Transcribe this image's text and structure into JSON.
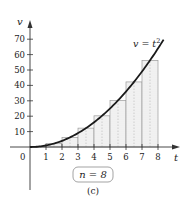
{
  "chart_data": {
    "type": "bar",
    "title": "",
    "subtitle": "",
    "xlabel": "t",
    "ylabel": "v",
    "xlim": [
      0,
      8
    ],
    "ylim": [
      0,
      70
    ],
    "x_ticks": [
      1,
      2,
      3,
      4,
      5,
      6,
      7,
      8
    ],
    "y_ticks": [
      10,
      20,
      30,
      40,
      50,
      60,
      70
    ],
    "origin_label": "0",
    "grid": false,
    "legend": null,
    "curve": {
      "label": "v = t²",
      "function": "t^2",
      "x": [
        0,
        1,
        2,
        3,
        4,
        5,
        6,
        7,
        8
      ],
      "y": [
        0,
        1,
        4,
        9,
        16,
        25,
        36,
        49,
        64
      ]
    },
    "rectangles": {
      "method": "midpoint",
      "n": 8,
      "intervals": [
        [
          0,
          1
        ],
        [
          1,
          2
        ],
        [
          2,
          3
        ],
        [
          3,
          4
        ],
        [
          4,
          5
        ],
        [
          5,
          6
        ],
        [
          6,
          7
        ],
        [
          7,
          8
        ]
      ],
      "midpoints": [
        0.5,
        1.5,
        2.5,
        3.5,
        4.5,
        5.5,
        6.5,
        7.5
      ],
      "heights": [
        0.25,
        2.25,
        6.25,
        12.25,
        20.25,
        30.25,
        42.25,
        56.25
      ]
    },
    "annotations": [
      "v = t²",
      "n = 8",
      "(c)"
    ]
  },
  "labels": {
    "y_axis": "v",
    "x_axis": "t",
    "origin": "0",
    "equation_v": "v = t",
    "equation_exp": "2",
    "n_box": "n = 8",
    "caption": "(c)"
  },
  "colors": {
    "axis": "#333333",
    "curve": "#1a1a1a",
    "rect_fill": "#f1f1f1",
    "rect_stroke": "#9a9a9a",
    "midline": "#b5b5b5",
    "n_box_stroke": "#999999"
  }
}
